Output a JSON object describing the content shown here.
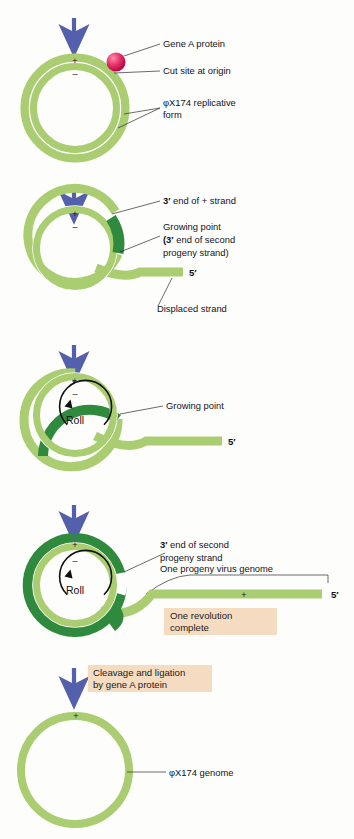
{
  "figure": {
    "colors": {
      "light_green": "#a9cd70",
      "mid_green": "#9cc566",
      "dark_green": "#2f8a3e",
      "arrow_blue": "#5560ac",
      "callout_bg": "#f5dcc0",
      "protein_pink": "#e0245e",
      "background": "#fdfdfb",
      "leader_line": "#2b2b33"
    },
    "panels": [
      {
        "id": "panel-1",
        "name": "replicative-form",
        "labels": [
          {
            "id": "gene-a-protein",
            "text": "Gene A protein"
          },
          {
            "id": "cut-site",
            "text": "Cut site at origin"
          },
          {
            "id": "replicative-form-line1",
            "text": "φX174 replicative"
          },
          {
            "id": "replicative-form-line2",
            "text": "form"
          }
        ],
        "strand_signs": {
          "plus": "+",
          "minus": "–"
        }
      },
      {
        "id": "panel-2",
        "name": "initiation-displacement",
        "labels": [
          {
            "id": "three-prime-plus-strand-bold",
            "text": "3′"
          },
          {
            "id": "three-prime-plus-strand",
            "text": " end of + strand"
          },
          {
            "id": "growing-point",
            "text": "Growing point"
          },
          {
            "id": "growing-point-sub-bold",
            "text": "(3′"
          },
          {
            "id": "growing-point-sub",
            "text": " end of second"
          },
          {
            "id": "growing-point-sub2",
            "text": "progeny strand)"
          },
          {
            "id": "five-prime-end",
            "text": "5′"
          },
          {
            "id": "displaced-strand",
            "text": "Displaced strand"
          }
        ],
        "strand_signs": {
          "plus": "+",
          "minus": "–"
        }
      },
      {
        "id": "panel-3",
        "name": "rolling",
        "labels": [
          {
            "id": "growing-point",
            "text": "Growing point"
          },
          {
            "id": "five-prime-end",
            "text": "5′"
          },
          {
            "id": "roll",
            "text": "Roll"
          }
        ],
        "strand_signs": {
          "plus": "+",
          "minus": "–"
        }
      },
      {
        "id": "panel-4",
        "name": "one-revolution-complete",
        "labels": [
          {
            "id": "three-prime-second-progeny-bold",
            "text": "3′"
          },
          {
            "id": "three-prime-second-progeny",
            "text": " end of second"
          },
          {
            "id": "three-prime-second-progeny2",
            "text": "progeny strand"
          },
          {
            "id": "one-progeny-virus-genome",
            "text": "One progeny virus genome"
          },
          {
            "id": "five-prime-end",
            "text": "5′"
          },
          {
            "id": "roll",
            "text": "Roll"
          },
          {
            "id": "tail-plus-sign",
            "text": "+"
          }
        ],
        "callout": {
          "id": "one-revolution-complete",
          "line1": "One revolution",
          "line2": "complete"
        },
        "strand_signs": {
          "plus": "+",
          "minus": "–"
        }
      },
      {
        "id": "panel-5",
        "name": "circular-genome-product",
        "labels": [
          {
            "id": "phix174-genome",
            "text": "φX174 genome"
          }
        ],
        "callout": {
          "id": "cleavage-ligation",
          "line1": "Cleavage and ligation",
          "line2": "by gene A protein"
        },
        "strand_signs": {
          "plus": "+"
        }
      }
    ],
    "arrows": [
      {
        "id": "step-arrow-1"
      },
      {
        "id": "step-arrow-2"
      },
      {
        "id": "step-arrow-3"
      },
      {
        "id": "step-arrow-4"
      },
      {
        "id": "step-arrow-5"
      }
    ]
  }
}
